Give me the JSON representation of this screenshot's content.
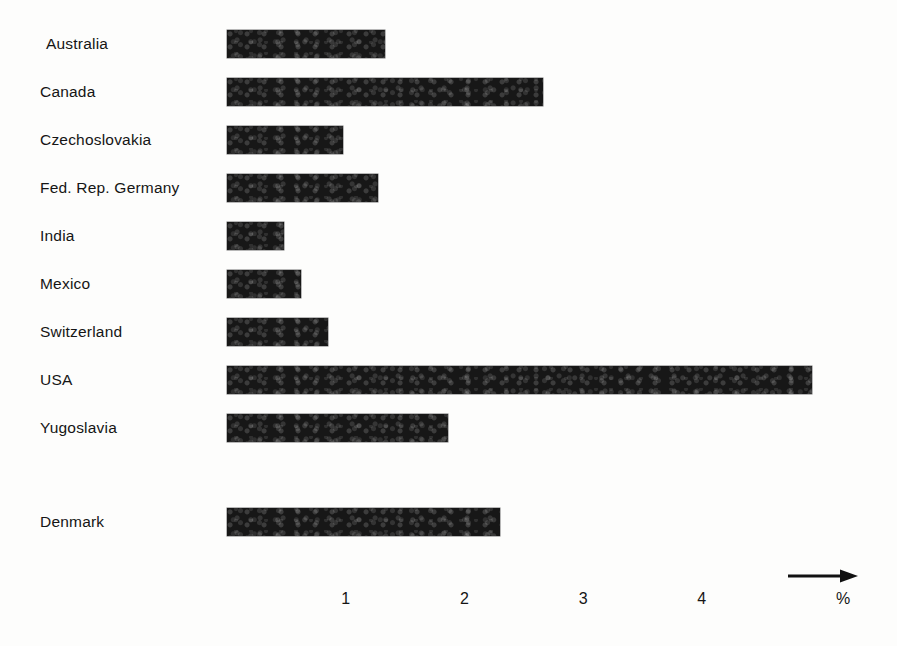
{
  "chart_data": {
    "type": "bar",
    "orientation": "horizontal",
    "title": "",
    "subtitle": "",
    "xlabel": "%",
    "ylabel": "",
    "categories": [
      "Australia",
      "Canada",
      "Czechoslovakia",
      "Fed. Rep. Germany",
      "India",
      "Mexico",
      "Switzerland",
      "USA",
      "Yugoslavia",
      "Denmark"
    ],
    "values": [
      1.33,
      2.66,
      0.98,
      1.27,
      0.48,
      0.62,
      0.85,
      4.93,
      1.86,
      2.3
    ],
    "xlim": [
      0,
      5.2
    ],
    "xticks": [
      1,
      2,
      3,
      4
    ],
    "xtick_labels": [
      "1",
      "2",
      "3",
      "4"
    ],
    "grid": false,
    "legend": null,
    "axis_arrow": "right-arrow-icon",
    "bars": [
      {
        "label": "Australia",
        "value": 1.33,
        "group": "main",
        "indent": true
      },
      {
        "label": "Canada",
        "value": 2.66,
        "group": "main",
        "indent": false
      },
      {
        "label": "Czechoslovakia",
        "value": 0.98,
        "group": "main",
        "indent": false
      },
      {
        "label": "Fed. Rep. Germany",
        "value": 1.27,
        "group": "main",
        "indent": false
      },
      {
        "label": "India",
        "value": 0.48,
        "group": "main",
        "indent": false
      },
      {
        "label": "Mexico",
        "value": 0.62,
        "group": "main",
        "indent": false
      },
      {
        "label": "Switzerland",
        "value": 0.85,
        "group": "main",
        "indent": false
      },
      {
        "label": "USA",
        "value": 4.93,
        "group": "main",
        "indent": false
      },
      {
        "label": "Yugoslavia",
        "value": 1.86,
        "group": "main",
        "indent": false
      },
      {
        "label": "Denmark",
        "value": 2.3,
        "group": "separate",
        "indent": false
      }
    ],
    "colors": {
      "bar": "#171717",
      "background": "#fdfdfc",
      "text": "#151515"
    }
  }
}
